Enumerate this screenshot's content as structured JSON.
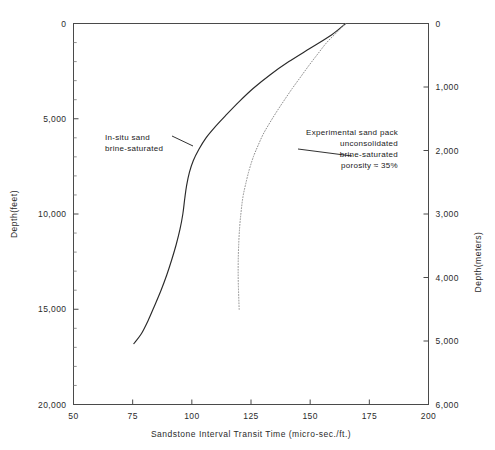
{
  "chart_data": {
    "type": "line",
    "title": "",
    "xlabel": "Sandstone Interval Transit Time (micro-sec./ft.)",
    "ylabel": "Depth(feet)",
    "y2label": "Depth(meters)",
    "xlim": [
      50,
      200
    ],
    "ylim": [
      20000,
      0
    ],
    "y2lim": [
      6000,
      0
    ],
    "grid": false,
    "legend": "none (inline annotations with leader lines)",
    "y_inverted": true,
    "xticks": [
      50,
      75,
      100,
      125,
      150,
      175,
      200
    ],
    "xticklabels": [
      "50",
      "75",
      "100",
      "125",
      "150",
      "175",
      "200"
    ],
    "yticks": [
      0,
      5000,
      10000,
      15000,
      20000
    ],
    "yticklabels": [
      "0",
      "5,000",
      "10,000",
      "15,000",
      "20,000"
    ],
    "yminorticks": [
      1000,
      2000,
      3000,
      4000,
      6000,
      7000,
      8000,
      9000,
      11000,
      12000,
      13000,
      14000,
      16000,
      17000,
      18000,
      19000
    ],
    "y2ticks": [
      0,
      1000,
      2000,
      3000,
      4000,
      5000,
      6000
    ],
    "y2ticklabels": [
      "0",
      "1,000",
      "2,000",
      "3,000",
      "4,000",
      "5,000",
      "6,000"
    ],
    "series": [
      {
        "name": "In-situ sand brine-saturated",
        "style": "solid",
        "color": "#2a2a2a",
        "points": [
          [
            165.0,
            0
          ],
          [
            159.0,
            600
          ],
          [
            150.0,
            1300
          ],
          [
            141.0,
            2000
          ],
          [
            133.0,
            2700
          ],
          [
            126.0,
            3400
          ],
          [
            120.0,
            4100
          ],
          [
            114.5,
            4800
          ],
          [
            110.0,
            5400
          ],
          [
            106.0,
            6000
          ],
          [
            103.0,
            6600
          ],
          [
            100.6,
            7200
          ],
          [
            99.0,
            7800
          ],
          [
            97.8,
            8500
          ],
          [
            97.0,
            9200
          ],
          [
            96.2,
            10000
          ],
          [
            95.0,
            10800
          ],
          [
            93.4,
            11600
          ],
          [
            91.5,
            12400
          ],
          [
            89.4,
            13200
          ],
          [
            87.0,
            14000
          ],
          [
            84.3,
            14800
          ],
          [
            81.5,
            15600
          ],
          [
            78.6,
            16300
          ],
          [
            75.5,
            16800
          ]
        ]
      },
      {
        "name": "Experimental sand pack unconsolidated brine-saturated porosity = 35%",
        "style": "dotted",
        "color": "#8d8d8d",
        "points": [
          [
            165.0,
            0
          ],
          [
            161.0,
            500
          ],
          [
            157.0,
            1000
          ],
          [
            153.2,
            1600
          ],
          [
            149.5,
            2200
          ],
          [
            146.0,
            2800
          ],
          [
            142.5,
            3400
          ],
          [
            139.2,
            4000
          ],
          [
            136.0,
            4600
          ],
          [
            133.0,
            5200
          ],
          [
            130.2,
            5800
          ],
          [
            128.0,
            6400
          ],
          [
            126.0,
            7000
          ],
          [
            124.2,
            7700
          ],
          [
            122.8,
            8400
          ],
          [
            121.6,
            9100
          ],
          [
            120.8,
            9900
          ],
          [
            120.2,
            10700
          ],
          [
            119.8,
            11600
          ],
          [
            119.6,
            12500
          ],
          [
            119.6,
            13400
          ],
          [
            119.8,
            14300
          ],
          [
            120.0,
            15000
          ]
        ]
      }
    ],
    "annotations": [
      {
        "id": "in-situ",
        "lines": [
          "In-situ  sand",
          "brine-saturated"
        ],
        "align": "left",
        "target": [
          100,
          6600
        ]
      },
      {
        "id": "sand-pack",
        "lines": [
          "Experimental  sand  pack",
          "unconsolidated",
          "brine-saturated",
          "porosity ≈ 35%"
        ],
        "align": "right",
        "target": [
          128,
          6900
        ]
      }
    ]
  }
}
